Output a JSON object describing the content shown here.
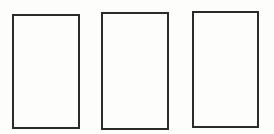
{
  "canvas": {
    "width_px": 274,
    "height_px": 134,
    "background_color": "#fdfdfc"
  },
  "shapes": {
    "description": "three empty vertical rectangles, outlined, no text",
    "stroke_color": "#2b2b2b",
    "stroke_width_px": 2,
    "fill_color": "transparent",
    "rectangles": [
      {
        "x": 12,
        "y": 14,
        "width": 68,
        "height": 115
      },
      {
        "x": 101,
        "y": 12,
        "width": 68,
        "height": 118
      },
      {
        "x": 192,
        "y": 11,
        "width": 67,
        "height": 117
      }
    ]
  }
}
